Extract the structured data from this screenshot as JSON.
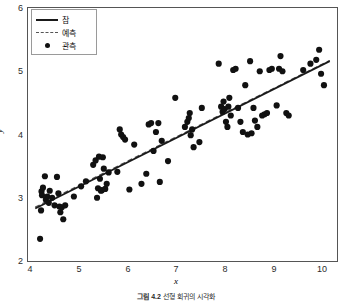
{
  "chart_data": {
    "type": "scatter",
    "title": "",
    "xlabel": "x",
    "ylabel": "y",
    "xlim": [
      3.85,
      10.25
    ],
    "ylim": [
      2.0,
      6.0
    ],
    "xticks": [
      4,
      5,
      6,
      7,
      8,
      9,
      10
    ],
    "yticks": [
      2,
      3,
      4,
      5,
      6
    ],
    "grid": false,
    "legend_position": "upper left",
    "legend": [
      {
        "label": "참",
        "style": "solid-line",
        "color": "#1a1a1a"
      },
      {
        "label": "예측",
        "style": "dashed-line",
        "color": "#555555"
      },
      {
        "label": "관측",
        "style": "marker-dot",
        "color": "#111111"
      }
    ],
    "series": [
      {
        "name": "참",
        "type": "line",
        "style": "solid",
        "color": "#1a1a1a",
        "x": [
          4.0,
          10.1
        ],
        "y": [
          2.83,
          5.16
        ]
      },
      {
        "name": "예측",
        "type": "line",
        "style": "dashed",
        "color": "#555555",
        "x": [
          4.0,
          10.1
        ],
        "y": [
          2.85,
          5.17
        ]
      },
      {
        "name": "관측",
        "type": "scatter",
        "marker": "circle",
        "color": "#111111",
        "points": [
          [
            4.1,
            2.35
          ],
          [
            4.12,
            2.8
          ],
          [
            4.13,
            3.1
          ],
          [
            4.14,
            3.04
          ],
          [
            4.16,
            3.16
          ],
          [
            4.2,
            3.34
          ],
          [
            4.22,
            2.97
          ],
          [
            4.25,
            3.02
          ],
          [
            4.28,
            2.92
          ],
          [
            4.3,
            3.11
          ],
          [
            4.35,
            3.0
          ],
          [
            4.4,
            2.88
          ],
          [
            4.45,
            3.33
          ],
          [
            4.48,
            3.07
          ],
          [
            4.5,
            2.86
          ],
          [
            4.52,
            2.77
          ],
          [
            4.55,
            2.85
          ],
          [
            4.58,
            2.66
          ],
          [
            4.62,
            2.88
          ],
          [
            4.8,
            3.02
          ],
          [
            4.95,
            3.18
          ],
          [
            5.05,
            3.26
          ],
          [
            5.2,
            3.52
          ],
          [
            5.25,
            3.59
          ],
          [
            5.28,
            3.0
          ],
          [
            5.3,
            3.15
          ],
          [
            5.32,
            3.65
          ],
          [
            5.34,
            3.3
          ],
          [
            5.36,
            3.11
          ],
          [
            5.38,
            3.12
          ],
          [
            5.4,
            3.64
          ],
          [
            5.42,
            3.46
          ],
          [
            5.45,
            3.14
          ],
          [
            5.48,
            3.22
          ],
          [
            5.52,
            3.4
          ],
          [
            5.7,
            3.41
          ],
          [
            5.75,
            4.08
          ],
          [
            5.78,
            4.0
          ],
          [
            5.82,
            3.96
          ],
          [
            5.86,
            3.92
          ],
          [
            5.95,
            3.13
          ],
          [
            6.05,
            3.84
          ],
          [
            6.2,
            3.22
          ],
          [
            6.3,
            3.38
          ],
          [
            6.35,
            4.16
          ],
          [
            6.4,
            4.18
          ],
          [
            6.45,
            3.74
          ],
          [
            6.5,
            4.04
          ],
          [
            6.55,
            4.18
          ],
          [
            6.58,
            3.25
          ],
          [
            6.62,
            3.9
          ],
          [
            6.75,
            3.58
          ],
          [
            6.9,
            4.58
          ],
          [
            7.1,
            4.12
          ],
          [
            7.15,
            4.2
          ],
          [
            7.18,
            4.26
          ],
          [
            7.2,
            4.34
          ],
          [
            7.22,
            3.99
          ],
          [
            7.25,
            4.08
          ],
          [
            7.28,
            3.8
          ],
          [
            7.4,
            3.88
          ],
          [
            7.45,
            4.42
          ],
          [
            7.8,
            5.12
          ],
          [
            7.85,
            4.44
          ],
          [
            7.88,
            4.36
          ],
          [
            7.9,
            4.52
          ],
          [
            7.92,
            4.4
          ],
          [
            7.95,
            4.2
          ],
          [
            7.98,
            4.12
          ],
          [
            8.0,
            4.44
          ],
          [
            8.02,
            4.58
          ],
          [
            8.05,
            4.3
          ],
          [
            8.1,
            5.02
          ],
          [
            8.15,
            5.04
          ],
          [
            8.2,
            4.42
          ],
          [
            8.25,
            4.2
          ],
          [
            8.3,
            4.04
          ],
          [
            8.35,
            4.78
          ],
          [
            8.4,
            4.0
          ],
          [
            8.45,
            5.16
          ],
          [
            8.48,
            4.02
          ],
          [
            8.52,
            4.42
          ],
          [
            8.55,
            4.22
          ],
          [
            8.6,
            4.12
          ],
          [
            8.65,
            5.0
          ],
          [
            8.7,
            4.3
          ],
          [
            8.75,
            4.32
          ],
          [
            8.8,
            4.34
          ],
          [
            8.85,
            5.02
          ],
          [
            8.9,
            5.04
          ],
          [
            9.0,
            4.46
          ],
          [
            9.05,
            5.04
          ],
          [
            9.08,
            5.24
          ],
          [
            9.12,
            5.0
          ],
          [
            9.2,
            4.34
          ],
          [
            9.25,
            4.3
          ],
          [
            9.55,
            5.02
          ],
          [
            9.7,
            5.12
          ],
          [
            9.82,
            5.18
          ],
          [
            9.88,
            5.34
          ],
          [
            9.92,
            4.96
          ],
          [
            9.98,
            4.78
          ]
        ]
      }
    ]
  },
  "caption": {
    "number": "그림 4.2",
    "text": "선형 회귀의 시각화"
  }
}
